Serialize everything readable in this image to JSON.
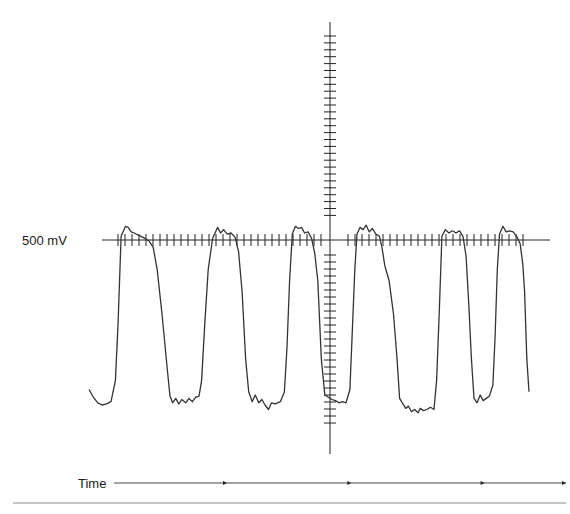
{
  "chart_data": {
    "type": "line",
    "title": "",
    "ylabel": "500 mV",
    "xlabel": "Time",
    "grid": false,
    "legend": "none",
    "reference_level_label": "500 mV",
    "units": {
      "y": "mV",
      "x": "time (arbitrary)"
    },
    "colors": {
      "trace": "#333333",
      "axis": "#222222",
      "divider": "#888888"
    },
    "axes": {
      "vertical_tick_count_above": 27,
      "vertical_tick_count_below": 25,
      "horizontal_tick_count_left": 30,
      "horizontal_tick_count_right": 26
    },
    "time_axis": {
      "label": "Time",
      "arrow_marker_positions": [
        0.25,
        0.525,
        0.82,
        1.0
      ]
    },
    "series": [
      {
        "name": "waveform",
        "x_range": [
          0,
          100
        ],
        "y_range": [
          -100,
          100
        ],
        "points": [
          [
            0,
            -68
          ],
          [
            1,
            -75
          ],
          [
            2,
            -80
          ],
          [
            3,
            -82
          ],
          [
            4,
            -81
          ],
          [
            5,
            -79
          ],
          [
            6,
            -60
          ],
          [
            6.6,
            -10
          ],
          [
            7.3,
            70
          ],
          [
            8.3,
            79
          ],
          [
            8.9,
            78
          ],
          [
            9.6,
            74
          ],
          [
            10.3,
            73
          ],
          [
            11.2,
            71
          ],
          [
            12.3,
            69
          ],
          [
            13.6,
            66
          ],
          [
            14.6,
            60
          ],
          [
            15.5,
            40
          ],
          [
            16.6,
            0
          ],
          [
            17.8,
            -50
          ],
          [
            18.4,
            -74
          ],
          [
            19.0,
            -80
          ],
          [
            19.7,
            -76
          ],
          [
            20.4,
            -81
          ],
          [
            21.1,
            -77
          ],
          [
            22.0,
            -80
          ],
          [
            22.7,
            -76
          ],
          [
            23.5,
            -79
          ],
          [
            24.2,
            -75
          ],
          [
            25.0,
            -74
          ],
          [
            25.6,
            -60
          ],
          [
            26.3,
            -10
          ],
          [
            27.1,
            40
          ],
          [
            28.1,
            68
          ],
          [
            29.2,
            78
          ],
          [
            29.9,
            73
          ],
          [
            30.6,
            76
          ],
          [
            31.4,
            72
          ],
          [
            32.3,
            73
          ],
          [
            33.2,
            69
          ],
          [
            34.0,
            56
          ],
          [
            34.8,
            20
          ],
          [
            35.6,
            -40
          ],
          [
            36.3,
            -70
          ],
          [
            37.1,
            -79
          ],
          [
            37.8,
            -73
          ],
          [
            38.6,
            -80
          ],
          [
            39.3,
            -77
          ],
          [
            40.0,
            -82
          ],
          [
            40.8,
            -86
          ],
          [
            41.5,
            -80
          ],
          [
            42.3,
            -81
          ],
          [
            43.5,
            -79
          ],
          [
            44.4,
            -70
          ],
          [
            45.0,
            -30
          ],
          [
            45.6,
            30
          ],
          [
            46.2,
            72
          ],
          [
            46.9,
            79
          ],
          [
            47.6,
            77
          ],
          [
            48.3,
            78
          ],
          [
            49.0,
            73
          ],
          [
            49.8,
            74
          ],
          [
            50.6,
            68
          ],
          [
            51.3,
            55
          ],
          [
            52.0,
            30
          ],
          [
            52.8,
            -40
          ],
          [
            53.6,
            -73
          ],
          [
            54.4,
            -75
          ],
          [
            55.2,
            -77
          ],
          [
            56.0,
            -78
          ],
          [
            56.8,
            -80
          ],
          [
            57.6,
            -79
          ],
          [
            58.4,
            -80
          ],
          [
            59.3,
            -68
          ],
          [
            59.8,
            -20
          ],
          [
            60.4,
            40
          ],
          [
            60.9,
            72
          ],
          [
            61.6,
            78
          ],
          [
            62.3,
            76
          ],
          [
            63.0,
            80
          ],
          [
            63.7,
            74
          ],
          [
            64.4,
            77
          ],
          [
            65.2,
            72
          ],
          [
            66.0,
            70
          ],
          [
            66.6,
            60
          ],
          [
            67.2,
            44
          ],
          [
            68.2,
            30
          ],
          [
            69.2,
            0
          ],
          [
            70.0,
            -40
          ],
          [
            70.6,
            -76
          ],
          [
            71.2,
            -80
          ],
          [
            72.0,
            -85
          ],
          [
            72.6,
            -83
          ],
          [
            73.3,
            -88
          ],
          [
            74.0,
            -86
          ],
          [
            74.8,
            -89
          ],
          [
            75.3,
            -85
          ],
          [
            76.0,
            -87
          ],
          [
            76.8,
            -86
          ],
          [
            77.6,
            -84
          ],
          [
            78.4,
            -86
          ],
          [
            79.0,
            -60
          ],
          [
            79.6,
            0
          ],
          [
            80.2,
            70
          ],
          [
            81.0,
            76
          ],
          [
            81.8,
            73
          ],
          [
            82.6,
            75
          ],
          [
            83.4,
            73
          ],
          [
            84.2,
            75
          ],
          [
            85.0,
            70
          ],
          [
            85.7,
            52
          ],
          [
            86.3,
            10
          ],
          [
            86.9,
            -40
          ],
          [
            87.5,
            -76
          ],
          [
            88.2,
            -80
          ],
          [
            88.9,
            -73
          ],
          [
            89.6,
            -78
          ],
          [
            90.3,
            -76
          ],
          [
            91.0,
            -74
          ],
          [
            91.8,
            -64
          ],
          [
            92.3,
            -20
          ],
          [
            92.8,
            40
          ],
          [
            93.3,
            72
          ],
          [
            94.1,
            79
          ],
          [
            94.8,
            74
          ],
          [
            95.6,
            75
          ],
          [
            96.4,
            74
          ],
          [
            97.2,
            70
          ],
          [
            98.0,
            63
          ],
          [
            98.6,
            45
          ],
          [
            99.0,
            20
          ],
          [
            99.5,
            -40
          ],
          [
            100,
            -70
          ]
        ]
      }
    ]
  }
}
